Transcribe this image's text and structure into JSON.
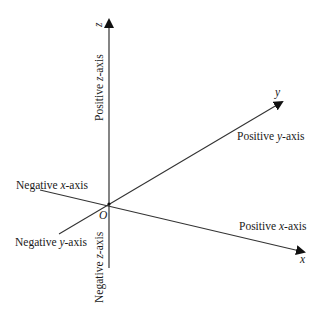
{
  "diagram": {
    "origin": {
      "label": "O",
      "x": 109,
      "y": 204
    },
    "axes": {
      "z": {
        "label": "z",
        "positive_label_prefix": "Positive ",
        "negative_label_prefix": "Negative ",
        "var": "z",
        "suffix": "-axis"
      },
      "y": {
        "label": "y",
        "positive_label_prefix": "Positive ",
        "negative_label_prefix": "Negative ",
        "var": "y",
        "suffix": "-axis"
      },
      "x": {
        "label": "x",
        "positive_label_prefix": "Positive ",
        "negative_label_prefix": "Negative ",
        "var": "x",
        "suffix": "-axis"
      }
    },
    "line_color": "#333333",
    "text_color": "#1a1a1a"
  }
}
